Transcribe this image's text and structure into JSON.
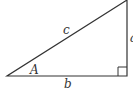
{
  "diagram": {
    "type": "right-triangle",
    "labels": {
      "hypotenuse": "c",
      "angle": "A",
      "base": "b",
      "opposite": "a"
    },
    "right_angle_marker": true,
    "stroke_color": "#333333"
  }
}
